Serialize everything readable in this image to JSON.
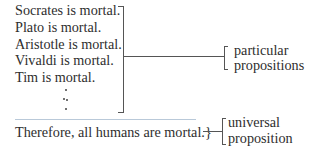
{
  "premises": [
    "Socrates is mortal.",
    "Plato is mortal.",
    "Aristotle is mortal.",
    "Vivaldi is mortal.",
    "Tim is mortal."
  ],
  "ellipsis": "vertical dots",
  "conclusion": "Therefore, all humans are mortal.",
  "conclusion_brace": "}",
  "labels": {
    "particular": [
      "particular",
      "propositions"
    ],
    "universal": [
      "universal",
      "proposition"
    ]
  },
  "colors": {
    "text": "#2e2e2e",
    "bracket": "#555555",
    "separator": "#b9c9d9"
  }
}
